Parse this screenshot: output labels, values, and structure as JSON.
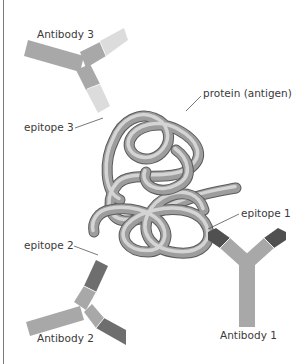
{
  "figure": {
    "colors": {
      "antibody_body": "#a8a8a8",
      "antibody1_tip": "#505050",
      "antibody2_tip": "#6e6e6e",
      "antibody3_tip": "#dcdcdc",
      "protein_tube": "#9d9d9d",
      "label_text": "#3a3a3a"
    },
    "labels": {
      "antibody1": "Antibody 1",
      "antibody2": "Antibody 2",
      "antibody3": "Antibody 3",
      "epitope1": "epitope 1",
      "epitope2": "epitope 2",
      "epitope3": "epitope 3",
      "protein": "protein (antigen)"
    }
  }
}
